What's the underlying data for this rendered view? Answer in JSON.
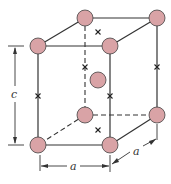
{
  "diagram": {
    "atom_color": "#d9a3a6",
    "line_color": "#333333",
    "labels": {
      "height": "c",
      "width": "a",
      "depth": "a"
    },
    "atoms": [
      {
        "id": "top-back-left",
        "x": 85,
        "y": 18
      },
      {
        "id": "top-back-right",
        "x": 157,
        "y": 18
      },
      {
        "id": "top-front-left",
        "x": 38,
        "y": 46
      },
      {
        "id": "top-front-right",
        "x": 110,
        "y": 46
      },
      {
        "id": "body-center",
        "x": 98,
        "y": 80
      },
      {
        "id": "bottom-back-left",
        "x": 85,
        "y": 115
      },
      {
        "id": "bottom-back-right",
        "x": 157,
        "y": 115
      },
      {
        "id": "bottom-front-left",
        "x": 38,
        "y": 145
      },
      {
        "id": "bottom-front-right",
        "x": 110,
        "y": 145
      }
    ],
    "interstitial_sites": [
      {
        "id": "top-face-center",
        "x": 98,
        "y": 32
      },
      {
        "id": "bottom-face-center",
        "x": 98,
        "y": 130
      },
      {
        "id": "edge-front-left",
        "x": 38,
        "y": 96
      },
      {
        "id": "edge-front-right",
        "x": 110,
        "y": 96
      },
      {
        "id": "edge-back-left",
        "x": 85,
        "y": 67
      },
      {
        "id": "edge-back-right",
        "x": 157,
        "y": 67
      }
    ]
  }
}
